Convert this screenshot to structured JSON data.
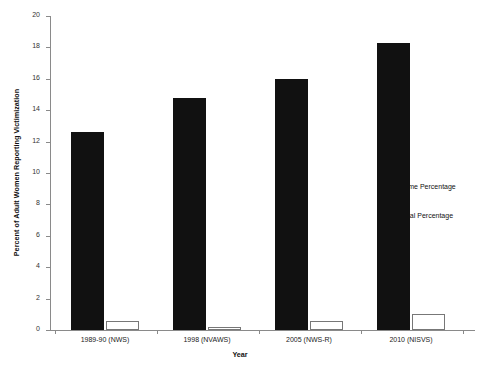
{
  "chart_data": {
    "type": "bar",
    "title": "",
    "xlabel": "Year",
    "ylabel": "Percent of Adult Women Reporting Victimization",
    "categories": [
      "1989-90 (NWS)",
      "1998 (NVAWS)",
      "2005 (NWS-R)",
      "2010 (NISVS)"
    ],
    "series": [
      {
        "name": "Lifetime Percentage",
        "values": [
          12.6,
          14.8,
          16.0,
          18.3
        ],
        "color": "#111111",
        "marker": "filled-square"
      },
      {
        "name": "Annual Percentage",
        "values": [
          0.6,
          0.2,
          0.6,
          1.0
        ],
        "color": "#ffffff",
        "marker": "open-square"
      }
    ],
    "ylim": [
      0,
      20
    ],
    "yticks": [
      0,
      2,
      4,
      6,
      8,
      10,
      12,
      14,
      16,
      18,
      20
    ],
    "ytick_labels": [
      "0",
      "2",
      "4",
      "6",
      "8",
      "10",
      "12",
      "14",
      "16",
      "18",
      "20"
    ],
    "grid": false,
    "legend_position": "right"
  },
  "legend": {
    "entries": [
      {
        "label": "Lifetime Percentage"
      },
      {
        "label": "Annual Percentage"
      }
    ]
  }
}
